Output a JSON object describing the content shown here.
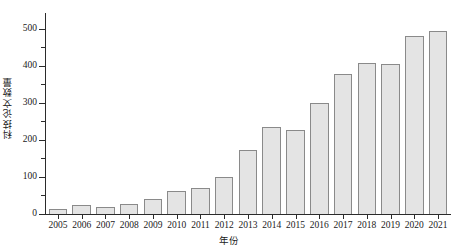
{
  "chart_data": {
    "type": "bar",
    "title": "",
    "xlabel": "年份",
    "ylabel": "科技论文数量",
    "categories": [
      "2005",
      "2006",
      "2007",
      "2008",
      "2009",
      "2010",
      "2011",
      "2012",
      "2013",
      "2014",
      "2015",
      "2016",
      "2017",
      "2018",
      "2019",
      "2020",
      "2021"
    ],
    "values": [
      14,
      23,
      18,
      28,
      40,
      62,
      70,
      101,
      172,
      234,
      228,
      300,
      379,
      409,
      406,
      480,
      495
    ],
    "ylim": [
      0,
      540
    ],
    "yticks": [
      0,
      100,
      200,
      300,
      400,
      500
    ],
    "ytick_labels": [
      "0",
      "100",
      "200",
      "300",
      "400",
      "500"
    ],
    "yminor_ticks": [
      50,
      150,
      250,
      350,
      450
    ],
    "grid": false,
    "legend": false,
    "bar_fill": "#e4e4e4",
    "bar_edge": "#8a8a8a",
    "axis_color": "#2b2b2b"
  }
}
